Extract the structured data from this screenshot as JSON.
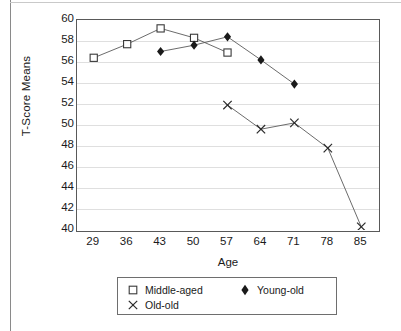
{
  "chart_data": {
    "type": "line",
    "title": "",
    "xlabel": "Age",
    "ylabel": "T-Score Means",
    "xlim": [
      25.5,
      88.5
    ],
    "ylim": [
      40,
      60
    ],
    "xticks": [
      29,
      36,
      43,
      50,
      57,
      64,
      71,
      78,
      85
    ],
    "yticks": [
      60,
      58,
      56,
      54,
      52,
      50,
      48,
      46,
      44,
      42,
      40
    ],
    "grid": "horizontal",
    "legend_position": "bottom",
    "series": [
      {
        "name": "Middle-aged",
        "marker": "open-square",
        "x": [
          29,
          36,
          43,
          50,
          57
        ],
        "values": [
          56.4,
          57.7,
          59.2,
          58.3,
          56.9
        ]
      },
      {
        "name": "Young-old",
        "marker": "filled-diamond",
        "x": [
          43,
          50,
          57,
          64,
          71
        ],
        "values": [
          57.0,
          57.6,
          58.4,
          56.2,
          53.9
        ]
      },
      {
        "name": "Old-old",
        "marker": "cross",
        "x": [
          57,
          64,
          71,
          78,
          85
        ],
        "values": [
          51.9,
          49.6,
          50.2,
          47.8,
          40.3
        ]
      }
    ]
  },
  "legend": {
    "items": [
      {
        "label": "Middle-aged",
        "marker": "open-square"
      },
      {
        "label": "Young-old",
        "marker": "filled-diamond"
      },
      {
        "label": "Old-old",
        "marker": "cross"
      }
    ]
  },
  "colors": {
    "axis": "#595959",
    "grid": "#dfdfdf",
    "line": "#5a5a5a",
    "marker_fill": "#1a1a1a",
    "marker_open": "#ffffff",
    "text": "#1a1a1a",
    "page_border": "#8a8a8a"
  }
}
